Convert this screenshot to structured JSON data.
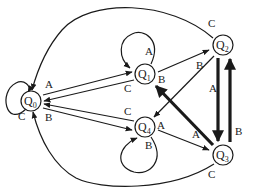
{
  "diagram": {
    "type": "state-transition-diagram",
    "colors": {
      "stroke": "#1a1a1a",
      "background": "#ffffff"
    },
    "nodes": [
      {
        "id": "Q0",
        "label": "Q",
        "sub": "0"
      },
      {
        "id": "Q1",
        "label": "Q",
        "sub": "1"
      },
      {
        "id": "Q2",
        "label": "Q",
        "sub": "2"
      },
      {
        "id": "Q3",
        "label": "Q",
        "sub": "3"
      },
      {
        "id": "Q4",
        "label": "Q",
        "sub": "4"
      }
    ],
    "edges": [
      {
        "from": "Q0",
        "to": "Q0",
        "label": "C",
        "style": "normal"
      },
      {
        "from": "Q0",
        "to": "Q1",
        "label": "A",
        "style": "normal"
      },
      {
        "from": "Q0",
        "to": "Q4",
        "label": "B",
        "style": "normal"
      },
      {
        "from": "Q1",
        "to": "Q0",
        "label": "C",
        "style": "normal"
      },
      {
        "from": "Q1",
        "to": "Q1",
        "label": "A",
        "style": "normal"
      },
      {
        "from": "Q1",
        "to": "Q2",
        "label": "B",
        "style": "normal"
      },
      {
        "from": "Q2",
        "to": "Q0",
        "label": "C",
        "style": "normal"
      },
      {
        "from": "Q2",
        "to": "Q4",
        "label": "B",
        "style": "normal"
      },
      {
        "from": "Q2",
        "to": "Q3",
        "label": "A",
        "style": "thick"
      },
      {
        "from": "Q3",
        "to": "Q2",
        "label": "B",
        "style": "thick"
      },
      {
        "from": "Q3",
        "to": "Q1",
        "label": "A",
        "style": "thick"
      },
      {
        "from": "Q3",
        "to": "Q0",
        "label": "C",
        "style": "normal"
      },
      {
        "from": "Q4",
        "to": "Q0",
        "label": "C",
        "style": "normal"
      },
      {
        "from": "Q4",
        "to": "Q3",
        "label": "A",
        "style": "normal"
      },
      {
        "from": "Q4",
        "to": "Q4",
        "label": "B",
        "style": "normal"
      }
    ]
  }
}
